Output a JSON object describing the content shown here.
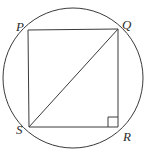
{
  "figure": {
    "kind": "circle-inscribed-quadrilateral",
    "canvas": {
      "width": 147,
      "height": 156
    },
    "colors": {
      "background": "#ffffff",
      "stroke": "#3a3a3a",
      "label": "#2b2b2b"
    },
    "circle": {
      "cx": 73,
      "cy": 78,
      "r": 70,
      "stroke_width": 1
    },
    "vertices": [
      {
        "name": "P",
        "label": "P",
        "x": 28,
        "y": 30
      },
      {
        "name": "Q",
        "label": "Q",
        "x": 118,
        "y": 29
      },
      {
        "name": "R",
        "label": "R",
        "x": 118,
        "y": 127
      },
      {
        "name": "S",
        "label": "S",
        "x": 29,
        "y": 127
      }
    ],
    "edges": [
      {
        "name": "PQ",
        "from": "P",
        "to": "Q"
      },
      {
        "name": "QR",
        "from": "Q",
        "to": "R"
      },
      {
        "name": "RS",
        "from": "R",
        "to": "S"
      },
      {
        "name": "SP",
        "from": "S",
        "to": "P"
      }
    ],
    "diagonal": {
      "name": "SQ",
      "from": "S",
      "to": "Q"
    },
    "right_angle_mark": {
      "at": "R",
      "size": 10
    }
  }
}
